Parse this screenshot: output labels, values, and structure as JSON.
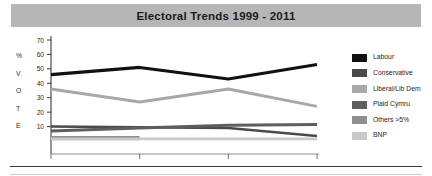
{
  "title": {
    "text": "Electoral Trends 1999 - 2011",
    "banner_color": "#b6b6b6"
  },
  "axis": {
    "y_side_label": "% V O T E",
    "y_side_letters": [
      "%",
      "V",
      "O",
      "T",
      "E"
    ],
    "x_axis_name": "YEAR"
  },
  "legend": {
    "items": [
      {
        "label": "Labour",
        "color": "#111111"
      },
      {
        "label": "Conservative",
        "color": "#4a4a4a"
      },
      {
        "label": "Liberal/Lib Dem",
        "color": "#a8a8a8"
      },
      {
        "label": "Plaid Cymru",
        "color": "#5e5e5e"
      },
      {
        "label": "Others >5%",
        "color": "#8f8f8f"
      },
      {
        "label": "BNP",
        "color": "#c9c9c9"
      }
    ]
  },
  "chart_data": {
    "type": "line",
    "title": "Electoral Trends 1999 - 2011",
    "xlabel": "YEAR",
    "ylabel": "% VOTE",
    "categories": [
      "1999",
      "2003",
      "2007",
      "2011"
    ],
    "x_tick_labels": [
      "1999",
      "2003",
      "2007",
      "2011"
    ],
    "y_tick_labels": [
      "10",
      "20",
      "30",
      "40",
      "50",
      "60",
      "70"
    ],
    "y_ticks": [
      10,
      20,
      30,
      40,
      50,
      60,
      70
    ],
    "ylim": [
      0,
      70
    ],
    "grid": false,
    "legend_position": "right",
    "series": [
      {
        "name": "Labour",
        "color": "#111111",
        "values": [
          46,
          51,
          43,
          53
        ]
      },
      {
        "name": "Conservative",
        "color": "#4a4a4a",
        "values": [
          10,
          9.5,
          9,
          3.5
        ]
      },
      {
        "name": "Liberal/Lib Dem",
        "color": "#a8a8a8",
        "values": [
          36,
          27,
          36,
          24
        ]
      },
      {
        "name": "Plaid Cymru",
        "color": "#5e5e5e",
        "values": [
          7,
          9,
          11,
          11.5
        ]
      },
      {
        "name": "Others >5%",
        "color": "#8f8f8f",
        "values": [
          2,
          2,
          null,
          null
        ]
      },
      {
        "name": "BNP",
        "color": "#c9c9c9",
        "values": [
          1.5,
          1.5,
          1.5,
          1.5
        ]
      }
    ]
  }
}
